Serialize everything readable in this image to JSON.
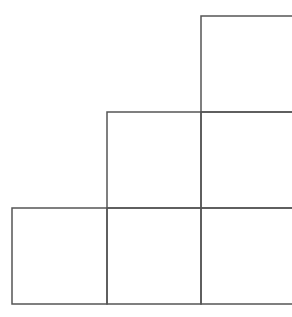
{
  "diagram": {
    "type": "staircase-grid",
    "stroke_color": "#555555",
    "background": "#ffffff",
    "rows": [
      {
        "row": 1,
        "cells": 1
      },
      {
        "row": 2,
        "cells": 2
      },
      {
        "row": 3,
        "cells": 3
      }
    ]
  }
}
